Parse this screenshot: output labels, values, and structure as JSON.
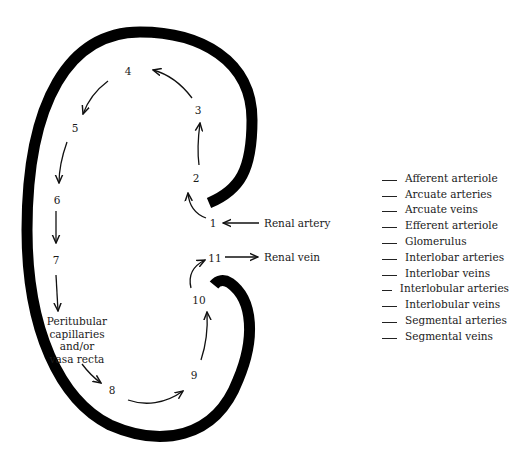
{
  "diagram": {
    "steps": [
      {
        "id": "1",
        "label": "1",
        "x": 213,
        "y": 223
      },
      {
        "id": "2",
        "label": "2",
        "x": 196,
        "y": 178
      },
      {
        "id": "3",
        "label": "3",
        "x": 198,
        "y": 110
      },
      {
        "id": "4",
        "label": "4",
        "x": 128,
        "y": 71
      },
      {
        "id": "5",
        "label": "5",
        "x": 75,
        "y": 128
      },
      {
        "id": "6",
        "label": "6",
        "x": 57,
        "y": 200
      },
      {
        "id": "7",
        "label": "7",
        "x": 56,
        "y": 260
      },
      {
        "id": "8",
        "label": "8",
        "x": 112,
        "y": 390
      },
      {
        "id": "9",
        "label": "9",
        "x": 194,
        "y": 375
      },
      {
        "id": "10",
        "label": "10",
        "x": 199,
        "y": 300
      },
      {
        "id": "11",
        "label": "11",
        "x": 215,
        "y": 258
      }
    ],
    "peritubular_label": [
      "Peritubular",
      "capillaries",
      "and/or",
      "vasa recta"
    ],
    "renal_artery_label": "Renal artery",
    "renal_vein_label": "Renal vein"
  },
  "legend": {
    "items": [
      "Afferent arteriole",
      "Arcuate arteries",
      "Arcuate veins",
      "Efferent arteriole",
      "Glomerulus",
      "Interlobar arteries",
      "Interlobar veins",
      "Interlobular arteries",
      "Interlobular veins",
      "Segmental arteries",
      "Segmental veins"
    ]
  },
  "colors": {
    "outline": "#000000",
    "text": "#1a1a1a",
    "background": "#ffffff"
  }
}
